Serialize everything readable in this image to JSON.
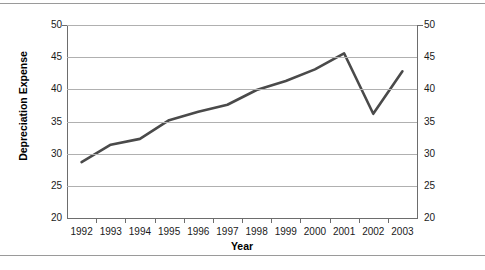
{
  "chart_data": {
    "type": "line",
    "title": "",
    "xlabel": "Year",
    "ylabel": "Depreciation Expense",
    "categories": [
      "1992",
      "1993",
      "1994",
      "1995",
      "1996",
      "1997",
      "1998",
      "1999",
      "2000",
      "2001",
      "2002",
      "2003"
    ],
    "values": [
      28.7,
      31.4,
      32.3,
      35.2,
      36.5,
      37.6,
      39.9,
      41.3,
      43.1,
      45.6,
      36.2,
      42.8
    ],
    "series": [
      {
        "name": "Depreciation Expense",
        "values": [
          28.7,
          31.4,
          32.3,
          35.2,
          36.5,
          37.6,
          39.9,
          41.3,
          43.1,
          45.6,
          36.2,
          42.8
        ]
      }
    ],
    "ylim": [
      20,
      50
    ],
    "yticks": [
      20,
      25,
      30,
      35,
      40,
      45,
      50
    ],
    "ytick_labels_left": [
      "50",
      "45",
      "40",
      "35",
      "30",
      "25",
      "20"
    ],
    "ytick_labels_right": [
      "50",
      "45",
      "40",
      "35",
      "30",
      "25",
      "20"
    ],
    "grid": true,
    "legend": "none",
    "dual_y_axis": true,
    "line_color": "#4a4a4a",
    "gridline_color": "#b0b0b0",
    "axis_color": "#6d6d6d",
    "background": "#ffffff"
  },
  "axes": {
    "y_title": "Depreciation Expense",
    "x_title": "Year"
  }
}
